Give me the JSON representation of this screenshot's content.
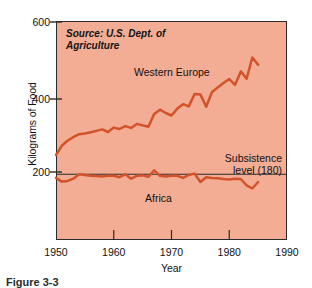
{
  "figure": {
    "caption": "Figure 3-3",
    "background_color": "#f2ad94",
    "line_color": "#d2532a",
    "frame_color": "#2b2b2b"
  },
  "chart_data": {
    "type": "line",
    "title": "",
    "subtitle": "",
    "xlabel": "Year",
    "ylabel": "Kilograms of Food",
    "xlim": [
      1950,
      1990
    ],
    "ylim": [
      0,
      600
    ],
    "xticks": [
      1950,
      1960,
      1970,
      1980,
      1990
    ],
    "yticks": [
      200,
      400,
      600
    ],
    "grid": false,
    "legend_position": "inline-annotations",
    "annotations": [
      {
        "name": "source-note",
        "text": "Source: U.S. Dept. of Agriculture",
        "style": "italic"
      },
      {
        "name": "subsistence-note",
        "text": "Subsistence level (180)",
        "line1": "Subsistence",
        "line2": "level (180)",
        "value": 180
      }
    ],
    "reference_lines": [
      {
        "name": "subsistence-level-line",
        "y": 180,
        "label": "Subsistence level (180)"
      }
    ],
    "x": [
      1950,
      1951,
      1952,
      1953,
      1954,
      1955,
      1956,
      1957,
      1958,
      1959,
      1960,
      1961,
      1962,
      1963,
      1964,
      1965,
      1966,
      1967,
      1968,
      1969,
      1970,
      1971,
      1972,
      1973,
      1974,
      1975,
      1976,
      1977,
      1978,
      1979,
      1980,
      1981,
      1982,
      1983,
      1984,
      1985
    ],
    "series": [
      {
        "name": "Western Europe",
        "label": "Western Europe",
        "color": "#d2532a",
        "values": [
          233,
          258,
          272,
          282,
          290,
          292,
          295,
          299,
          303,
          296,
          308,
          304,
          312,
          307,
          318,
          314,
          310,
          345,
          357,
          348,
          341,
          360,
          372,
          366,
          400,
          399,
          365,
          405,
          418,
          430,
          441,
          425,
          462,
          442,
          500,
          480
        ]
      },
      {
        "name": "Africa",
        "label": "Africa",
        "color": "#d2532a",
        "values": [
          170,
          160,
          162,
          168,
          180,
          178,
          176,
          175,
          174,
          176,
          176,
          172,
          180,
          168,
          176,
          177,
          173,
          191,
          176,
          174,
          176,
          176,
          170,
          178,
          182,
          159,
          172,
          170,
          169,
          167,
          166,
          168,
          167,
          150,
          141,
          159
        ]
      }
    ]
  },
  "axes": {
    "y_title": "Kilograms of Food",
    "x_title": "Year",
    "y_tick_labels": [
      "600",
      "400",
      "200"
    ],
    "x_tick_labels": [
      "1950",
      "1960",
      "1970",
      "1980",
      "1990"
    ]
  }
}
